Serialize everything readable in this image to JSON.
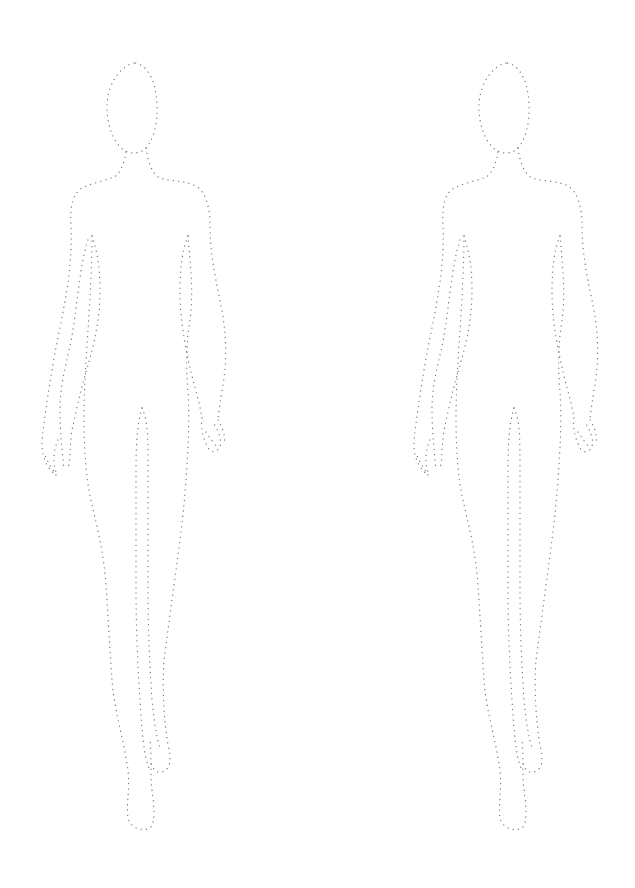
{
  "page": {
    "background": "#ffffff",
    "stroke_color": "#7a7a7a",
    "style": "dotted outline"
  },
  "figures": [
    {
      "label": "croquis-left",
      "offset_x": 0
    },
    {
      "label": "croquis-right",
      "offset_x": 372
    }
  ]
}
